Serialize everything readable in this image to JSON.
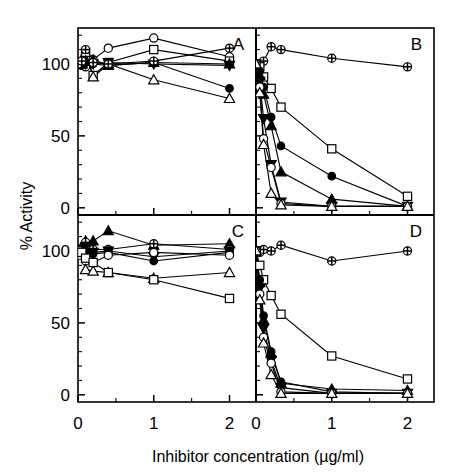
{
  "figure": {
    "xlabel": "Inhibitor concentration (µg/ml)",
    "ylabel": "% Activity",
    "panel_letters": [
      "A",
      "B",
      "C",
      "D"
    ],
    "x_ticks": [
      "0",
      "1",
      "2"
    ],
    "y_ticks": [
      "100",
      "50",
      "0"
    ],
    "y_ticks_lower": [
      "100",
      "50",
      "0"
    ],
    "colors": {
      "ink": "#000000",
      "background": "#ffffff"
    }
  },
  "chart_data": {
    "type": "line",
    "title": "",
    "xlabel": "Inhibitor concentration (µg/ml)",
    "ylabel": "% Activity",
    "xlim": [
      0,
      2.35
    ],
    "ylim": [
      -5,
      125
    ],
    "xticks": [
      0,
      1,
      2
    ],
    "yticks": [
      0,
      50,
      100
    ],
    "grid": false,
    "legend": "none",
    "panels": [
      {
        "letter": "A",
        "series": [
          {
            "name": "open-circle",
            "marker": "open-circle",
            "x": [
              0,
              0.05,
              0.1,
              0.2,
              0.4,
              1,
              2
            ],
            "y": [
              100,
              99,
              98,
              103,
              111,
              118,
              105
            ]
          },
          {
            "name": "open-square",
            "marker": "open-square",
            "x": [
              0,
              0.05,
              0.1,
              0.2,
              0.4,
              1,
              2
            ],
            "y": [
              100,
              101,
              108,
              92,
              101,
              110,
              102
            ]
          },
          {
            "name": "open-triangle",
            "marker": "open-triangle",
            "x": [
              0,
              0.05,
              0.1,
              0.2,
              0.4,
              1,
              2
            ],
            "y": [
              100,
              100,
              108,
              91,
              100,
              89,
              76
            ]
          },
          {
            "name": "filled-circle",
            "marker": "filled-circle",
            "x": [
              0,
              0.05,
              0.1,
              0.2,
              0.4,
              1,
              2
            ],
            "y": [
              100,
              99,
              101,
              100,
              99,
              101,
              83
            ]
          },
          {
            "name": "filled-triangle",
            "marker": "filled-triangle",
            "x": [
              0,
              0.05,
              0.1,
              0.2,
              0.4,
              1,
              2
            ],
            "y": [
              100,
              100,
              102,
              103,
              99,
              101,
              100
            ]
          },
          {
            "name": "filled-inverted-triangle",
            "marker": "filled-inverted-triangle",
            "x": [
              0,
              0.05,
              0.1,
              0.2,
              0.4,
              1,
              2
            ],
            "y": [
              100,
              101,
              100,
              100,
              101,
              100,
              99
            ]
          },
          {
            "name": "plus-circle",
            "marker": "plus-circle",
            "x": [
              0,
              0.05,
              0.1,
              0.2,
              0.4,
              1,
              2
            ],
            "y": [
              100,
              102,
              110,
              101,
              100,
              102,
              111
            ]
          }
        ]
      },
      {
        "letter": "B",
        "series": [
          {
            "name": "plus-circle",
            "marker": "plus-circle",
            "x": [
              0,
              0.05,
              0.1,
              0.2,
              0.33,
              1,
              2
            ],
            "y": [
              100,
              99,
              102,
              112,
              110,
              104,
              98
            ]
          },
          {
            "name": "open-square",
            "marker": "open-square",
            "x": [
              0,
              0.05,
              0.1,
              0.2,
              0.33,
              1,
              2
            ],
            "y": [
              100,
              98,
              91,
              83,
              70,
              41,
              8
            ]
          },
          {
            "name": "filled-circle",
            "marker": "filled-circle",
            "x": [
              0,
              0.05,
              0.1,
              0.2,
              0.33,
              1,
              2
            ],
            "y": [
              100,
              95,
              84,
              63,
              43,
              22,
              1
            ]
          },
          {
            "name": "filled-triangle",
            "marker": "filled-triangle",
            "x": [
              0,
              0.05,
              0.1,
              0.2,
              0.33,
              1,
              2
            ],
            "y": [
              100,
              92,
              79,
              57,
              25,
              6,
              1
            ]
          },
          {
            "name": "filled-inverted-triangle",
            "marker": "filled-inverted-triangle",
            "x": [
              0,
              0.05,
              0.1,
              0.2,
              0.33,
              1,
              2
            ],
            "y": [
              100,
              88,
              62,
              30,
              4,
              1,
              1
            ]
          },
          {
            "name": "open-circle",
            "marker": "open-circle",
            "x": [
              0,
              0.05,
              0.1,
              0.2,
              0.33,
              1,
              2
            ],
            "y": [
              100,
              84,
              48,
              28,
              3,
              1,
              1
            ]
          },
          {
            "name": "open-triangle",
            "marker": "open-triangle",
            "x": [
              0,
              0.05,
              0.1,
              0.2,
              0.33,
              1,
              2
            ],
            "y": [
              100,
              80,
              44,
              10,
              2,
              1,
              1
            ]
          }
        ]
      },
      {
        "letter": "C",
        "series": [
          {
            "name": "filled-triangle",
            "marker": "filled-triangle",
            "x": [
              0,
              0.05,
              0.1,
              0.2,
              0.4,
              1,
              2
            ],
            "y": [
              100,
              103,
              107,
              107,
              114,
              104,
              105
            ]
          },
          {
            "name": "plus-circle",
            "marker": "plus-circle",
            "x": [
              0,
              0.05,
              0.1,
              0.2,
              0.4,
              1,
              2
            ],
            "y": [
              100,
              102,
              106,
              101,
              101,
              105,
              101
            ]
          },
          {
            "name": "filled-inverted-triangle",
            "marker": "filled-inverted-triangle",
            "x": [
              0,
              0.05,
              0.1,
              0.2,
              0.4,
              1,
              2
            ],
            "y": [
              100,
              101,
              103,
              99,
              100,
              96,
              100
            ]
          },
          {
            "name": "filled-circle",
            "marker": "filled-circle",
            "x": [
              0,
              0.05,
              0.1,
              0.2,
              0.4,
              1,
              2
            ],
            "y": [
              100,
              100,
              99,
              98,
              99,
              93,
              99
            ]
          },
          {
            "name": "open-circle",
            "marker": "open-circle",
            "x": [
              0,
              0.05,
              0.1,
              0.2,
              0.4,
              1,
              2
            ],
            "y": [
              100,
              98,
              93,
              92,
              97,
              99,
              97
            ]
          },
          {
            "name": "open-triangle",
            "marker": "open-triangle",
            "x": [
              0,
              0.05,
              0.1,
              0.2,
              0.4,
              1,
              2
            ],
            "y": [
              100,
              97,
              87,
              86,
              85,
              81,
              85
            ]
          },
          {
            "name": "open-square",
            "marker": "open-square",
            "x": [
              0,
              0.05,
              0.1,
              0.2,
              0.4,
              1,
              2
            ],
            "y": [
              100,
              99,
              95,
              92,
              85,
              80,
              67
            ]
          }
        ]
      },
      {
        "letter": "D",
        "series": [
          {
            "name": "plus-circle",
            "marker": "plus-circle",
            "x": [
              0,
              0.05,
              0.1,
              0.2,
              0.33,
              1,
              2
            ],
            "y": [
              100,
              99,
              101,
              100,
              104,
              93,
              100
            ]
          },
          {
            "name": "open-square",
            "marker": "open-square",
            "x": [
              0,
              0.05,
              0.1,
              0.2,
              0.33,
              1,
              2
            ],
            "y": [
              100,
              90,
              80,
              69,
              56,
              27,
              11
            ]
          },
          {
            "name": "filled-circle",
            "marker": "filled-circle",
            "x": [
              0,
              0.05,
              0.1,
              0.2,
              0.33,
              1,
              2
            ],
            "y": [
              100,
              80,
              55,
              30,
              9,
              2,
              1
            ]
          },
          {
            "name": "filled-triangle",
            "marker": "filled-triangle",
            "x": [
              0,
              0.05,
              0.1,
              0.2,
              0.33,
              1,
              2
            ],
            "y": [
              100,
              78,
              52,
              29,
              8,
              4,
              3
            ]
          },
          {
            "name": "filled-inverted-triangle",
            "marker": "filled-inverted-triangle",
            "x": [
              0,
              0.05,
              0.1,
              0.2,
              0.33,
              1,
              2
            ],
            "y": [
              100,
              74,
              46,
              24,
              5,
              1,
              1
            ]
          },
          {
            "name": "open-circle",
            "marker": "open-circle",
            "x": [
              0,
              0.05,
              0.1,
              0.2,
              0.33,
              1,
              2
            ],
            "y": [
              100,
              70,
              40,
              22,
              2,
              1,
              1
            ]
          },
          {
            "name": "open-triangle",
            "marker": "open-triangle",
            "x": [
              0,
              0.05,
              0.1,
              0.2,
              0.33,
              1,
              2
            ],
            "y": [
              100,
              66,
              36,
              14,
              1,
              1,
              1
            ]
          }
        ]
      }
    ]
  }
}
